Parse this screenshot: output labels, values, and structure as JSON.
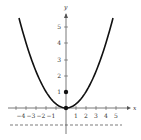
{
  "chart_data": {
    "type": "line",
    "title": "",
    "xlabel": "x",
    "ylabel": "y",
    "xlim": [
      -5,
      5.5
    ],
    "ylim": [
      -1.2,
      6
    ],
    "x_ticks": [
      "-4",
      "-3",
      "-2",
      "-1",
      "1",
      "2",
      "3",
      "4",
      "5"
    ],
    "y_ticks": [
      "1",
      "2",
      "3",
      "4",
      "5"
    ],
    "series": [
      {
        "name": "parabola x^2 = 4y",
        "equation": "y = x^2/4",
        "x_range": [
          -4.7,
          4.7
        ]
      }
    ],
    "points": [
      {
        "name": "vertex",
        "x": 0,
        "y": 0
      },
      {
        "name": "focus",
        "x": 0,
        "y": 1
      }
    ],
    "lines": [
      {
        "name": "directrix",
        "equation": "y = -1",
        "style": "dashed"
      }
    ],
    "grid": false,
    "legend": null
  },
  "labels": {
    "x_axis": "x",
    "y_axis": "y",
    "x_neg": [
      "-4",
      "-3",
      "-2",
      "-1"
    ],
    "x_pos": [
      "1",
      "2",
      "3",
      "4",
      "5"
    ],
    "y_pos": [
      "1",
      "2",
      "3",
      "4",
      "5"
    ]
  }
}
